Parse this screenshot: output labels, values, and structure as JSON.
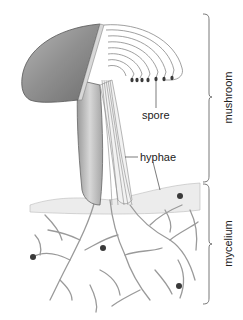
{
  "diagram": {
    "labels": {
      "spore": "spore",
      "hyphae": "hyphae",
      "mushroom": "mushroom",
      "mycelium": "mycelium"
    },
    "brackets": [
      {
        "name": "mushroom",
        "y_start": 14,
        "y_end": 182
      },
      {
        "name": "mycelium",
        "y_start": 184,
        "y_end": 304
      }
    ],
    "colors": {
      "cap": "#8a8a8a",
      "line": "#555555",
      "text": "#222222",
      "spore_dot": "#3a3a3a"
    }
  }
}
